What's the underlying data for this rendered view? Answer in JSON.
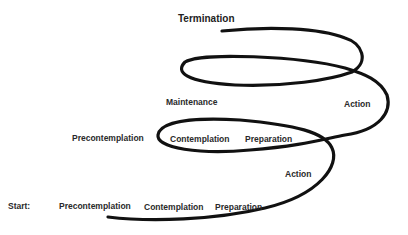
{
  "diagram": {
    "type": "spiral-of-change",
    "stroke_color": "#111111",
    "text_color": "#2a2a2a",
    "labels": {
      "start": "Start:",
      "start_row": [
        "Precontemplation",
        "Contemplation",
        "Preparation"
      ],
      "action_lower": "Action",
      "second_row": [
        "Precontemplation",
        "Contemplation",
        "Preparation"
      ],
      "maintenance": "Maintenance",
      "action_upper": "Action",
      "termination": "Termination"
    }
  }
}
